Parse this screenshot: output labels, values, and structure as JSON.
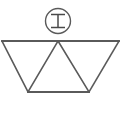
{
  "figure": {
    "background_color": "#ffffff",
    "stroke_color": "#5a5a5a",
    "stroke_width": 1.6,
    "canvas": {
      "width": 131,
      "height": 125
    }
  },
  "badge": {
    "name": "circled-letter-i",
    "letter": "I",
    "circle": {
      "cx": 58,
      "cy": 21,
      "r": 12.5
    },
    "letter_strokes": {
      "top_bar": {
        "x1": 51,
        "y1": 14.5,
        "x2": 65,
        "y2": 14.5
      },
      "stem": {
        "x1": 58,
        "y1": 14.5,
        "x2": 58,
        "y2": 27.5
      },
      "bottom_bar": {
        "x1": 51,
        "y1": 27.5,
        "x2": 65,
        "y2": 27.5
      }
    }
  },
  "trapezoid": {
    "name": "inverted-trapezoid",
    "top_left": {
      "x": 2,
      "y": 41
    },
    "top_right": {
      "x": 119,
      "y": 41
    },
    "bottom_left": {
      "x": 28,
      "y": 92
    },
    "bottom_right": {
      "x": 89,
      "y": 92
    }
  },
  "zigzag": {
    "name": "internal-zigzag",
    "apex_top": {
      "x": 58,
      "y": 41
    },
    "points": "28,92 58,41 89,92"
  },
  "labels": {
    "figure_label": "",
    "alt_text": "Circled letter I above a trapezoid with internal triangles"
  }
}
